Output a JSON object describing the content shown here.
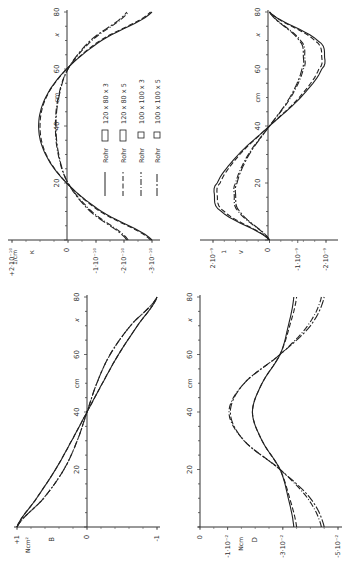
{
  "figure": {
    "orientation": "rotated 90° counter-clockwise",
    "x_axis_label": "x",
    "x_unit": "cm",
    "x_ticks": [
      "0",
      "20",
      "40",
      "60",
      "80"
    ]
  },
  "legend": {
    "items": [
      {
        "label": "Rohr",
        "section": "120 x 80 x 3",
        "shape": "rect",
        "style": "solid"
      },
      {
        "label": "Rohr",
        "section": "120 x 80 x 5",
        "shape": "rect",
        "style": "dashed"
      },
      {
        "label": "Rohr",
        "section": "100 x 100 x 3",
        "shape": "square",
        "style": "dashdot"
      },
      {
        "label": "Rohr",
        "section": "100 x 100 x 5",
        "shape": "square",
        "style": "longdash"
      }
    ]
  },
  "panels": {
    "kappa": {
      "symbol": "κ",
      "unit": "1/cm",
      "ticks": [
        "+2·10⁻¹⁰",
        "0",
        "-1·10⁻¹⁰",
        "-2·10⁻¹⁰",
        "-3·10⁻¹⁰"
      ]
    },
    "v": {
      "symbol": "v",
      "unit": "1",
      "ticks": [
        "2·10⁻⁹",
        "0",
        "-1·10⁻⁹",
        "-2·10⁻⁹"
      ]
    },
    "M": {
      "symbol": "B",
      "unit": "Ncm²",
      "ticks": [
        "+1",
        "0",
        "-1"
      ]
    },
    "N": {
      "symbol": "D",
      "unit": "Ncm",
      "ticks": [
        "0",
        "-1·10⁻²",
        "-3·10⁻²",
        "-5·10⁻²"
      ]
    }
  },
  "chart_data": [
    {
      "type": "line",
      "title": "Curvature κ along x",
      "xlabel": "x (cm)",
      "ylabel": "κ (1/cm)",
      "xlim": [
        0,
        80
      ],
      "ylim": [
        -3e-10,
        2e-10
      ],
      "x": [
        0,
        10,
        20,
        30,
        40,
        50,
        60,
        70,
        80
      ],
      "series": [
        {
          "name": "Rohr 120x80x3",
          "values": [
            -3e-10,
            -1.2e-10,
            5e-12,
            8e-11,
            1.05e-10,
            8e-11,
            5e-12,
            -1.2e-10,
            -3e-10
          ]
        },
        {
          "name": "Rohr 120x80x5",
          "values": [
            -2.95e-10,
            -1.15e-10,
            5e-12,
            7.8e-11,
            1e-10,
            7.8e-11,
            5e-12,
            -1.15e-10,
            -2.95e-10
          ]
        },
        {
          "name": "Rohr 100x100x3",
          "values": [
            -2.15e-10,
            -8.5e-11,
            0.0,
            3.5e-11,
            4.5e-11,
            3.5e-11,
            0.0,
            -8.5e-11,
            -2.15e-10
          ]
        },
        {
          "name": "Rohr 100x100x5",
          "values": [
            -2.1e-10,
            -8e-11,
            0.0,
            3.3e-11,
            4.3e-11,
            3.3e-11,
            0.0,
            -8e-11,
            -2.1e-10
          ]
        }
      ]
    },
    {
      "type": "line",
      "title": "Rotation v along x",
      "xlabel": "x (cm)",
      "ylabel": "v",
      "xlim": [
        0,
        80
      ],
      "ylim": [
        -2e-09,
        2e-09
      ],
      "x": [
        0,
        10,
        16,
        20,
        30,
        40,
        50,
        60,
        64,
        70,
        80
      ],
      "series": [
        {
          "name": "Rohr 120x80x3",
          "values": [
            0,
            1.7e-09,
            1.95e-09,
            1.85e-09,
            1.1e-09,
            0,
            -1.1e-09,
            -1.85e-09,
            -1.95e-09,
            -1.7e-09,
            0
          ]
        },
        {
          "name": "Rohr 120x80x5",
          "values": [
            0,
            1.6e-09,
            1.85e-09,
            1.75e-09,
            1.05e-09,
            0,
            -1.05e-09,
            -1.75e-09,
            -1.85e-09,
            -1.6e-09,
            0
          ]
        },
        {
          "name": "Rohr 100x100x3",
          "values": [
            0,
            1.1e-09,
            1.25e-09,
            1.2e-09,
            7.5e-10,
            0,
            -7.5e-10,
            -1.2e-09,
            -1.25e-09,
            -1.1e-09,
            0
          ]
        },
        {
          "name": "Rohr 100x100x5",
          "values": [
            0,
            1.05e-09,
            1.2e-09,
            1.15e-09,
            7.2e-10,
            0,
            -7.2e-10,
            -1.15e-09,
            -1.2e-09,
            -1.05e-09,
            0
          ]
        }
      ]
    },
    {
      "type": "line",
      "title": "Bimoment B along x",
      "xlabel": "x (cm)",
      "ylabel": "B (Ncm²)",
      "xlim": [
        0,
        80
      ],
      "ylim": [
        -1,
        1
      ],
      "x": [
        0,
        10,
        20,
        30,
        40,
        50,
        60,
        70,
        80
      ],
      "series": [
        {
          "name": "Rohr 120x80x3",
          "values": [
            1.0,
            0.72,
            0.45,
            0.22,
            0,
            -0.22,
            -0.45,
            -0.72,
            -1.0
          ]
        },
        {
          "name": "Rohr 120x80x5",
          "values": [
            1.0,
            0.72,
            0.45,
            0.22,
            0,
            -0.22,
            -0.45,
            -0.72,
            -1.0
          ]
        },
        {
          "name": "Rohr 100x100x3",
          "values": [
            1.0,
            0.62,
            0.33,
            0.14,
            0,
            -0.14,
            -0.33,
            -0.62,
            -1.0
          ]
        },
        {
          "name": "Rohr 100x100x5",
          "values": [
            1.0,
            0.62,
            0.33,
            0.14,
            0,
            -0.14,
            -0.33,
            -0.62,
            -1.0
          ]
        }
      ]
    },
    {
      "type": "line",
      "title": "Torsional moment D along x",
      "xlabel": "x (cm)",
      "ylabel": "D (Ncm)",
      "xlim": [
        0,
        80
      ],
      "ylim": [
        -0.05,
        0
      ],
      "x": [
        0,
        10,
        20,
        30,
        40,
        50,
        60,
        70,
        80
      ],
      "series": [
        {
          "name": "Rohr 120x80x3",
          "values": [
            -0.034,
            -0.032,
            -0.029,
            -0.0225,
            -0.019,
            -0.0225,
            -0.029,
            -0.032,
            -0.034
          ]
        },
        {
          "name": "Rohr 120x80x5",
          "values": [
            -0.035,
            -0.0325,
            -0.029,
            -0.0225,
            -0.019,
            -0.0225,
            -0.029,
            -0.0325,
            -0.035
          ]
        },
        {
          "name": "Rohr 100x100x3",
          "values": [
            -0.044,
            -0.039,
            -0.029,
            -0.016,
            -0.0105,
            -0.016,
            -0.029,
            -0.039,
            -0.044
          ]
        },
        {
          "name": "Rohr 100x100x5",
          "values": [
            -0.045,
            -0.04,
            -0.029,
            -0.016,
            -0.011,
            -0.016,
            -0.029,
            -0.04,
            -0.045
          ]
        }
      ]
    }
  ]
}
